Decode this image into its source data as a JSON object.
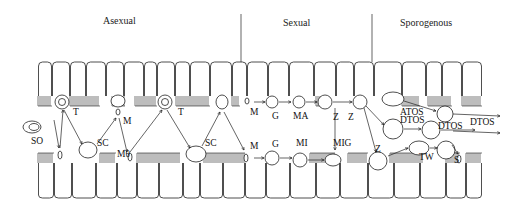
{
  "phases": [
    {
      "label": "Asexual",
      "x": 103,
      "y": 24
    },
    {
      "label": "Sexual",
      "x": 283,
      "y": 26
    },
    {
      "label": "Sporogenous",
      "x": 400,
      "y": 26
    }
  ],
  "dividers": [
    {
      "x": 241,
      "y1": 14,
      "y2": 62
    },
    {
      "x": 372,
      "y1": 14,
      "y2": 62
    }
  ],
  "stage_labels": [
    {
      "text": "SO",
      "x": 31,
      "y": 144
    },
    {
      "text": "T",
      "x": 73,
      "y": 115
    },
    {
      "text": "M",
      "x": 123,
      "y": 124
    },
    {
      "text": "SC",
      "x": 97,
      "y": 146
    },
    {
      "text": "Mθ",
      "x": 117,
      "y": 157
    },
    {
      "text": "T",
      "x": 178,
      "y": 115
    },
    {
      "text": "SC",
      "x": 205,
      "y": 146
    },
    {
      "text": "M",
      "x": 250,
      "y": 115
    },
    {
      "text": "M",
      "x": 250,
      "y": 149
    },
    {
      "text": "G",
      "x": 272,
      "y": 119
    },
    {
      "text": "MA",
      "x": 293,
      "y": 119
    },
    {
      "text": "Z",
      "x": 333,
      "y": 120
    },
    {
      "text": "Z",
      "x": 348,
      "y": 120
    },
    {
      "text": "G",
      "x": 272,
      "y": 147
    },
    {
      "text": "MI",
      "x": 296,
      "y": 146
    },
    {
      "text": "MIG",
      "x": 333,
      "y": 146
    },
    {
      "text": "Z",
      "x": 375,
      "y": 152
    },
    {
      "text": "ATOS",
      "x": 400,
      "y": 115
    },
    {
      "text": "DTOS",
      "x": 400,
      "y": 123
    },
    {
      "text": "DTOS",
      "x": 438,
      "y": 129
    },
    {
      "text": "DTOS",
      "x": 470,
      "y": 125
    },
    {
      "text": "TW",
      "x": 419,
      "y": 160
    },
    {
      "text": "S",
      "x": 454,
      "y": 163
    }
  ],
  "epithelium": {
    "top_row": {
      "y_top": 62,
      "y_bottom": 96,
      "x_start": 38,
      "x_end": 482
    },
    "bottom_row": {
      "y_top": 163,
      "y_bottom": 198,
      "x_start": 38,
      "x_end": 482
    },
    "cell_boundaries_top": [
      38,
      52,
      70,
      86,
      106,
      124,
      144,
      157,
      175,
      190,
      210,
      232,
      247,
      268,
      289,
      314,
      336,
      354,
      374,
      402,
      426,
      442,
      462,
      482
    ],
    "cell_boundaries_bottom": [
      38,
      54,
      72,
      96,
      117,
      137,
      159,
      183,
      200,
      223,
      245,
      266,
      290,
      316,
      340,
      368,
      394,
      420,
      446,
      466,
      482
    ]
  },
  "caption_colors": {
    "ink": "#222222",
    "background": "#ffffff"
  }
}
